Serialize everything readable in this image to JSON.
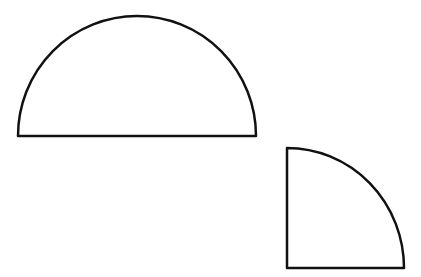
{
  "figure": {
    "background": "#ffffff",
    "stroke": "#111111",
    "stroke_width": 2.5,
    "shapes": [
      {
        "name": "semicircle",
        "center": [
          137,
          136
        ],
        "radius_x": 119,
        "radius_y": 120
      },
      {
        "name": "quarter-circle",
        "corner": [
          287,
          268
        ],
        "radius_x": 117,
        "radius_y": 120
      }
    ]
  }
}
